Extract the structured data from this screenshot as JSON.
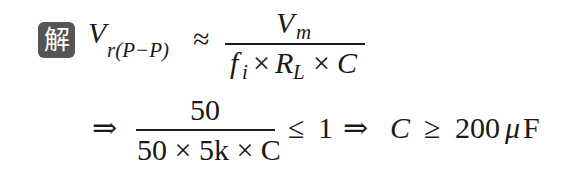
{
  "badge": {
    "label": "解",
    "color": "#555555"
  },
  "line1": {
    "lhs_var": "V",
    "lhs_sub": "r(P−P)",
    "relation": "≈",
    "numerator_var": "V",
    "numerator_sub": "m",
    "den_f": "f",
    "den_f_sub": "i",
    "den_times1": "×",
    "den_R": "R",
    "den_R_sub": "L",
    "den_times2": "×",
    "den_C": "C"
  },
  "line2": {
    "implies1": "⇒",
    "numerator": "50",
    "denominator": "50 × 5k × C",
    "leq": "≤",
    "one": "1",
    "implies2": "⇒",
    "C": "C",
    "geq": "≥",
    "value": "200",
    "unit_mu": "μ",
    "unit_F": "F"
  }
}
